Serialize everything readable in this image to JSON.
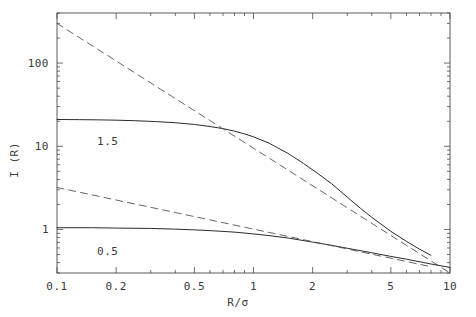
{
  "chart_data": {
    "type": "line",
    "title": "",
    "xlabel": "R/σ",
    "ylabel": "I (R)",
    "xscale": "log",
    "yscale": "log",
    "xlim": [
      0.1,
      10
    ],
    "ylim": [
      0.3,
      400
    ],
    "grid": false,
    "legend_position": "inline-annotations",
    "xticks": [
      {
        "value": 0.1,
        "label": "0.1"
      },
      {
        "value": 0.2,
        "label": "0.2"
      },
      {
        "value": 0.5,
        "label": "0.5"
      },
      {
        "value": 1,
        "label": "1"
      },
      {
        "value": 2,
        "label": "2"
      },
      {
        "value": 5,
        "label": "5"
      },
      {
        "value": 10,
        "label": "10"
      }
    ],
    "yticks": [
      {
        "value": 1,
        "label": "1"
      },
      {
        "value": 10,
        "label": "10"
      },
      {
        "value": 100,
        "label": "100"
      }
    ],
    "annotations": [
      {
        "text": "1.5",
        "x": 0.16,
        "y": 13.5
      },
      {
        "text": "0.5",
        "x": 0.16,
        "y": 0.66
      }
    ],
    "series": [
      {
        "name": "solid-1.5",
        "style": "solid",
        "color": "#2b2b2b",
        "label": "1.5",
        "x": [
          0.1,
          0.13,
          0.16,
          0.2,
          0.25,
          0.32,
          0.4,
          0.5,
          0.6,
          0.7,
          0.8,
          0.9,
          1.0,
          1.2,
          1.5,
          1.8,
          2.1,
          2.5,
          3.0,
          3.5,
          4.0,
          5.0,
          6.0,
          7.0,
          8.0
        ],
        "y": [
          21.0,
          20.9,
          20.8,
          20.6,
          20.3,
          19.8,
          19.2,
          18.3,
          17.3,
          16.3,
          15.2,
          14.1,
          13.0,
          10.9,
          8.2,
          6.2,
          4.8,
          3.55,
          2.45,
          1.8,
          1.4,
          0.95,
          0.72,
          0.58,
          0.49
        ]
      },
      {
        "name": "dashed-1.5-asymptote",
        "style": "dashed",
        "color": "#555555",
        "label": "",
        "slope": -1.5,
        "x": [
          0.1,
          10.0
        ],
        "y": [
          300.0,
          0.3
        ]
      },
      {
        "name": "solid-0.5",
        "style": "solid",
        "color": "#2b2b2b",
        "label": "0.5",
        "x": [
          0.1,
          0.15,
          0.2,
          0.3,
          0.4,
          0.5,
          0.6,
          0.8,
          1.0,
          1.2,
          1.5,
          2.0,
          2.5,
          3.0,
          4.0,
          5.0,
          6.0,
          8.0,
          10.0
        ],
        "y": [
          1.05,
          1.05,
          1.04,
          1.03,
          1.01,
          0.99,
          0.97,
          0.93,
          0.885,
          0.845,
          0.79,
          0.705,
          0.645,
          0.595,
          0.525,
          0.475,
          0.44,
          0.385,
          0.35
        ]
      },
      {
        "name": "dashed-0.5-asymptote",
        "style": "dashed",
        "color": "#555555",
        "label": "",
        "slope": -0.5,
        "x": [
          0.1,
          8.0
        ],
        "y": [
          3.2,
          0.357
        ]
      }
    ]
  },
  "axes": {
    "frame_color": "#4a4a4a",
    "left": 57,
    "right": 450,
    "top": 13,
    "bottom": 273
  }
}
